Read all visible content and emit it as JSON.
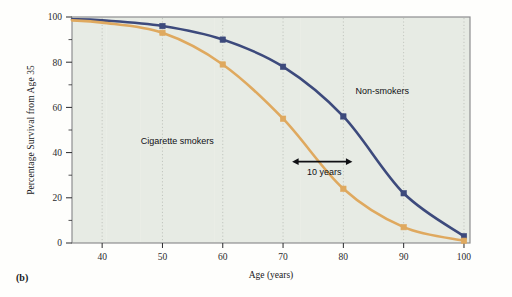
{
  "figure": {
    "panel_caption": "(b)",
    "background_color": "#e7ebe4",
    "border_color": "#8e8e90"
  },
  "chart_data": {
    "type": "line",
    "title": "",
    "xlabel": "Age (years)",
    "ylabel": "Percentage Survival from Age 35",
    "xlim": [
      35,
      101
    ],
    "ylim": [
      0,
      100
    ],
    "xticks": [
      40,
      50,
      60,
      70,
      80,
      90,
      100
    ],
    "xtick_labels": [
      "40",
      "50",
      "60",
      "70",
      "80",
      "90",
      "100"
    ],
    "yticks": [
      0,
      20,
      40,
      60,
      80,
      100
    ],
    "ytick_labels": [
      "0",
      "20",
      "40",
      "60",
      "80",
      "100"
    ],
    "grid": "vertical-dotted",
    "legend_position": "inline-annotation",
    "x": [
      35,
      40,
      50,
      60,
      70,
      80,
      90,
      100
    ],
    "series": [
      {
        "name": "Non-smokers",
        "color": "#3d4a7c",
        "marker": "square",
        "values": [
          99,
          98.5,
          96,
          90,
          78,
          56,
          22,
          3
        ]
      },
      {
        "name": "Cigarette smokers",
        "color": "#dfa95f",
        "marker": "square",
        "values": [
          98.5,
          97.5,
          93,
          79,
          55,
          24,
          7,
          1
        ]
      }
    ],
    "annotations": [
      {
        "name": "non-smokers-label",
        "text": "Non-smokers",
        "x": 82,
        "y": 66
      },
      {
        "name": "cigarette-smokers-label",
        "text": "Cigarette smokers",
        "x": 58.5,
        "y": 44
      },
      {
        "name": "gap-arrow-label",
        "text": "10 years",
        "x": 76.5,
        "y": 36,
        "arrow": "double-headed",
        "arrow_span_years": 10
      }
    ]
  }
}
